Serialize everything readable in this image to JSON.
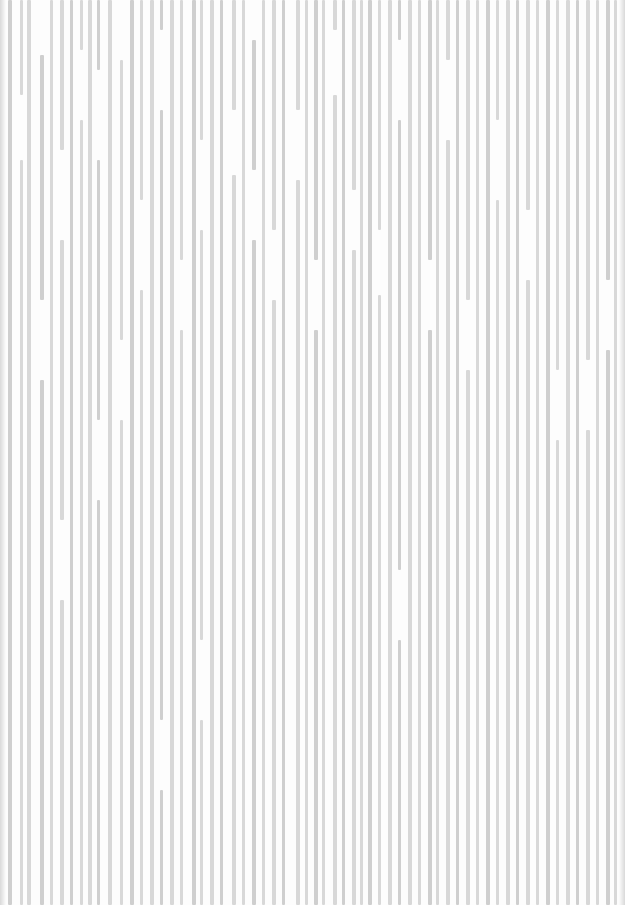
{
  "texture": {
    "description": "vertical grey stripe texture on white",
    "background": "#fdfdfd",
    "stripe_color": "#d8d8d8",
    "stripe_color_alt": "#cfcfcf",
    "width": 625,
    "height": 905,
    "columns": [
      {
        "x": 8,
        "w": 4,
        "segs": [
          [
            0,
            905
          ]
        ]
      },
      {
        "x": 20,
        "w": 3,
        "segs": [
          [
            0,
            95
          ],
          [
            160,
            905
          ]
        ]
      },
      {
        "x": 27,
        "w": 4,
        "segs": [
          [
            0,
            905
          ]
        ]
      },
      {
        "x": 40,
        "w": 4,
        "segs": [
          [
            55,
            300
          ],
          [
            380,
            905
          ]
        ]
      },
      {
        "x": 50,
        "w": 3,
        "segs": [
          [
            0,
            905
          ]
        ]
      },
      {
        "x": 60,
        "w": 4,
        "segs": [
          [
            0,
            150
          ],
          [
            240,
            520
          ],
          [
            600,
            905
          ]
        ]
      },
      {
        "x": 70,
        "w": 3,
        "segs": [
          [
            0,
            905
          ]
        ]
      },
      {
        "x": 80,
        "w": 3,
        "segs": [
          [
            0,
            50
          ],
          [
            120,
            905
          ]
        ]
      },
      {
        "x": 88,
        "w": 4,
        "segs": [
          [
            0,
            905
          ]
        ]
      },
      {
        "x": 97,
        "w": 3,
        "segs": [
          [
            0,
            70
          ],
          [
            160,
            420
          ],
          [
            500,
            905
          ]
        ]
      },
      {
        "x": 108,
        "w": 4,
        "segs": [
          [
            0,
            905
          ]
        ]
      },
      {
        "x": 120,
        "w": 3,
        "segs": [
          [
            60,
            340
          ],
          [
            420,
            905
          ]
        ]
      },
      {
        "x": 130,
        "w": 4,
        "segs": [
          [
            0,
            905
          ]
        ]
      },
      {
        "x": 140,
        "w": 3,
        "segs": [
          [
            0,
            200
          ],
          [
            290,
            905
          ]
        ]
      },
      {
        "x": 150,
        "w": 4,
        "segs": [
          [
            0,
            905
          ]
        ]
      },
      {
        "x": 160,
        "w": 3,
        "segs": [
          [
            0,
            30
          ],
          [
            110,
            720
          ],
          [
            790,
            905
          ]
        ]
      },
      {
        "x": 170,
        "w": 4,
        "segs": [
          [
            0,
            905
          ]
        ]
      },
      {
        "x": 180,
        "w": 3,
        "segs": [
          [
            0,
            260
          ],
          [
            330,
            905
          ]
        ]
      },
      {
        "x": 192,
        "w": 4,
        "segs": [
          [
            0,
            905
          ]
        ]
      },
      {
        "x": 200,
        "w": 3,
        "segs": [
          [
            0,
            140
          ],
          [
            230,
            640
          ],
          [
            720,
            905
          ]
        ]
      },
      {
        "x": 210,
        "w": 4,
        "segs": [
          [
            0,
            905
          ]
        ]
      },
      {
        "x": 220,
        "w": 3,
        "segs": [
          [
            0,
            905
          ]
        ]
      },
      {
        "x": 232,
        "w": 4,
        "segs": [
          [
            0,
            110
          ],
          [
            175,
            905
          ]
        ]
      },
      {
        "x": 242,
        "w": 3,
        "segs": [
          [
            0,
            905
          ]
        ]
      },
      {
        "x": 252,
        "w": 4,
        "segs": [
          [
            40,
            170
          ],
          [
            240,
            905
          ]
        ]
      },
      {
        "x": 262,
        "w": 3,
        "segs": [
          [
            0,
            905
          ]
        ]
      },
      {
        "x": 272,
        "w": 4,
        "segs": [
          [
            0,
            230
          ],
          [
            300,
            905
          ]
        ]
      },
      {
        "x": 282,
        "w": 3,
        "segs": [
          [
            0,
            905
          ]
        ]
      },
      {
        "x": 296,
        "w": 4,
        "segs": [
          [
            0,
            110
          ],
          [
            180,
            905
          ]
        ]
      },
      {
        "x": 305,
        "w": 3,
        "segs": [
          [
            0,
            905
          ]
        ]
      },
      {
        "x": 314,
        "w": 4,
        "segs": [
          [
            0,
            260
          ],
          [
            330,
            905
          ]
        ]
      },
      {
        "x": 322,
        "w": 3,
        "segs": [
          [
            0,
            905
          ]
        ]
      },
      {
        "x": 333,
        "w": 4,
        "segs": [
          [
            0,
            30
          ],
          [
            95,
            905
          ]
        ]
      },
      {
        "x": 342,
        "w": 3,
        "segs": [
          [
            0,
            905
          ]
        ]
      },
      {
        "x": 352,
        "w": 4,
        "segs": [
          [
            0,
            190
          ],
          [
            250,
            905
          ]
        ]
      },
      {
        "x": 360,
        "w": 3,
        "segs": [
          [
            0,
            905
          ]
        ]
      },
      {
        "x": 368,
        "w": 4,
        "segs": [
          [
            0,
            905
          ]
        ]
      },
      {
        "x": 378,
        "w": 3,
        "segs": [
          [
            0,
            230
          ],
          [
            295,
            905
          ]
        ]
      },
      {
        "x": 388,
        "w": 4,
        "segs": [
          [
            0,
            905
          ]
        ]
      },
      {
        "x": 398,
        "w": 3,
        "segs": [
          [
            0,
            40
          ],
          [
            120,
            570
          ],
          [
            640,
            905
          ]
        ]
      },
      {
        "x": 408,
        "w": 4,
        "segs": [
          [
            0,
            905
          ]
        ]
      },
      {
        "x": 418,
        "w": 3,
        "segs": [
          [
            0,
            905
          ]
        ]
      },
      {
        "x": 428,
        "w": 4,
        "segs": [
          [
            0,
            260
          ],
          [
            330,
            905
          ]
        ]
      },
      {
        "x": 436,
        "w": 3,
        "segs": [
          [
            0,
            905
          ]
        ]
      },
      {
        "x": 446,
        "w": 4,
        "segs": [
          [
            0,
            60
          ],
          [
            140,
            905
          ]
        ]
      },
      {
        "x": 456,
        "w": 3,
        "segs": [
          [
            0,
            905
          ]
        ]
      },
      {
        "x": 466,
        "w": 4,
        "segs": [
          [
            0,
            300
          ],
          [
            370,
            905
          ]
        ]
      },
      {
        "x": 476,
        "w": 3,
        "segs": [
          [
            0,
            905
          ]
        ]
      },
      {
        "x": 486,
        "w": 4,
        "segs": [
          [
            0,
            905
          ]
        ]
      },
      {
        "x": 496,
        "w": 3,
        "segs": [
          [
            0,
            120
          ],
          [
            200,
            905
          ]
        ]
      },
      {
        "x": 506,
        "w": 4,
        "segs": [
          [
            0,
            905
          ]
        ]
      },
      {
        "x": 516,
        "w": 3,
        "segs": [
          [
            0,
            905
          ]
        ]
      },
      {
        "x": 526,
        "w": 4,
        "segs": [
          [
            0,
            210
          ],
          [
            280,
            905
          ]
        ]
      },
      {
        "x": 536,
        "w": 3,
        "segs": [
          [
            0,
            905
          ]
        ]
      },
      {
        "x": 546,
        "w": 4,
        "segs": [
          [
            0,
            905
          ]
        ]
      },
      {
        "x": 556,
        "w": 3,
        "segs": [
          [
            0,
            370
          ],
          [
            440,
            905
          ]
        ]
      },
      {
        "x": 566,
        "w": 4,
        "segs": [
          [
            0,
            905
          ]
        ]
      },
      {
        "x": 576,
        "w": 3,
        "segs": [
          [
            0,
            905
          ]
        ]
      },
      {
        "x": 586,
        "w": 4,
        "segs": [
          [
            0,
            360
          ],
          [
            430,
            905
          ]
        ]
      },
      {
        "x": 596,
        "w": 3,
        "segs": [
          [
            0,
            905
          ]
        ]
      },
      {
        "x": 606,
        "w": 4,
        "segs": [
          [
            0,
            280
          ],
          [
            350,
            905
          ]
        ]
      },
      {
        "x": 614,
        "w": 3,
        "segs": [
          [
            0,
            905
          ]
        ]
      }
    ]
  }
}
